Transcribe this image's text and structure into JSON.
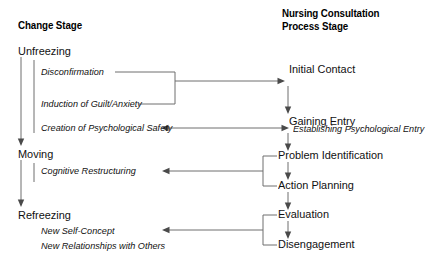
{
  "diagram": {
    "title_left": "Change Stage",
    "title_right_line1": "Nursing Consultation",
    "title_right_line2": "Process Stage",
    "left_column": {
      "stages": [
        {
          "name": "Unfreezing",
          "items": [
            "Disconfirmation",
            "Induction of Guilt/Anxiety",
            "Creation of Psychological Safety"
          ]
        },
        {
          "name": "Moving",
          "items": [
            "Cognitive Restructuring"
          ]
        },
        {
          "name": "Refreezing",
          "items": [
            "New Self-Concept",
            "New Relationships with Others"
          ]
        }
      ]
    },
    "right_column": {
      "steps": [
        "Initial Contact",
        "Gaining Entry",
        "Establishing Psychological Entry",
        "Problem Identification",
        "Action Planning",
        "Evaluation",
        "Disengagement"
      ]
    },
    "colors": {
      "background": "#ffffff",
      "text": "#111111",
      "line": "#6f6f6f",
      "arrowhead": "#4a4a4a"
    }
  }
}
